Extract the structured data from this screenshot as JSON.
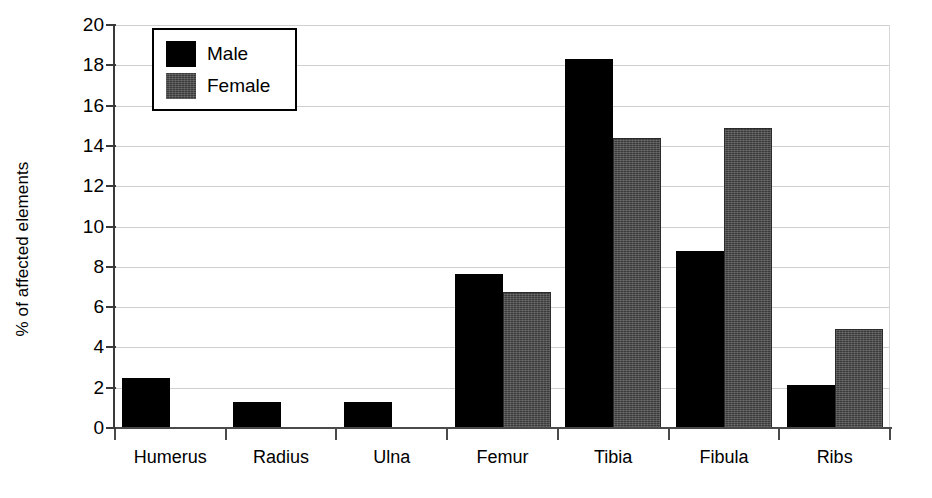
{
  "chart_data": {
    "type": "bar",
    "title": "",
    "xlabel": "",
    "ylabel": "% of affected elements",
    "categories": [
      "Humerus",
      "Radius",
      "Ulna",
      "Femur",
      "Tibia",
      "Fibula",
      "Ribs"
    ],
    "series": [
      {
        "name": "Male",
        "color": "#000000",
        "values": [
          2.5,
          1.3,
          1.3,
          7.65,
          18.3,
          8.8,
          2.15
        ]
      },
      {
        "name": "Female",
        "color": "#3b3b3b",
        "values": [
          0,
          0,
          0,
          6.75,
          14.4,
          14.9,
          4.9
        ]
      }
    ],
    "ylim": [
      0,
      20
    ],
    "ytick_step": 2,
    "ytick_labels": [
      "20",
      "18",
      "16",
      "14",
      "12",
      "10",
      "8",
      "6",
      "4",
      "2",
      "0"
    ],
    "grid": true,
    "grid_axis": "y",
    "legend_position": "top-left"
  },
  "legend": {
    "items": [
      {
        "label": "Male"
      },
      {
        "label": "Female"
      }
    ]
  },
  "axis": {
    "y_title": "% of affected elements"
  }
}
